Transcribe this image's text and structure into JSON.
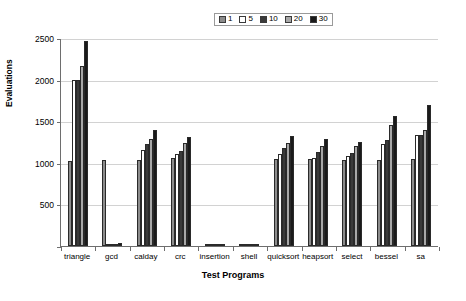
{
  "chart_data": {
    "type": "bar",
    "title": "",
    "xlabel": "Test Programs",
    "ylabel": "Evaluations",
    "ylim": [
      0,
      2500
    ],
    "yticks": [
      0,
      500,
      1000,
      1500,
      2000,
      2500
    ],
    "ytick_labels": [
      "0",
      "500",
      "1000",
      "1500",
      "2000",
      "2500"
    ],
    "grid": true,
    "legend_position": "top-center",
    "legend_title": "",
    "categories": [
      "triangle",
      "gcd",
      "calday",
      "crc",
      "insertion",
      "shell",
      "quicksort",
      "heapsort",
      "select",
      "bessel",
      "sa"
    ],
    "series": [
      {
        "name": "1",
        "color": "#8c8c8c",
        "values": [
          1020,
          1030,
          1030,
          1060,
          15,
          15,
          1040,
          1040,
          1030,
          1030,
          1040
        ]
      },
      {
        "name": "5",
        "color": "#ffffff",
        "values": [
          1990,
          20,
          1150,
          1100,
          18,
          18,
          1100,
          1060,
          1080,
          1230,
          1330
        ]
      },
      {
        "name": "10",
        "color": "#3a3a3a",
        "values": [
          2000,
          25,
          1230,
          1140,
          20,
          20,
          1180,
          1130,
          1120,
          1270,
          1340
        ]
      },
      {
        "name": "20",
        "color": "#a8a8a8",
        "values": [
          2160,
          30,
          1290,
          1240,
          22,
          22,
          1240,
          1200,
          1200,
          1450,
          1400
        ]
      },
      {
        "name": "30",
        "color": "#1a1a1a",
        "values": [
          2460,
          40,
          1400,
          1310,
          25,
          25,
          1320,
          1290,
          1250,
          1560,
          1690
        ]
      }
    ]
  },
  "legend": {
    "items": [
      {
        "label": "1"
      },
      {
        "label": "5"
      },
      {
        "label": "10"
      },
      {
        "label": "20"
      },
      {
        "label": "30"
      }
    ]
  }
}
